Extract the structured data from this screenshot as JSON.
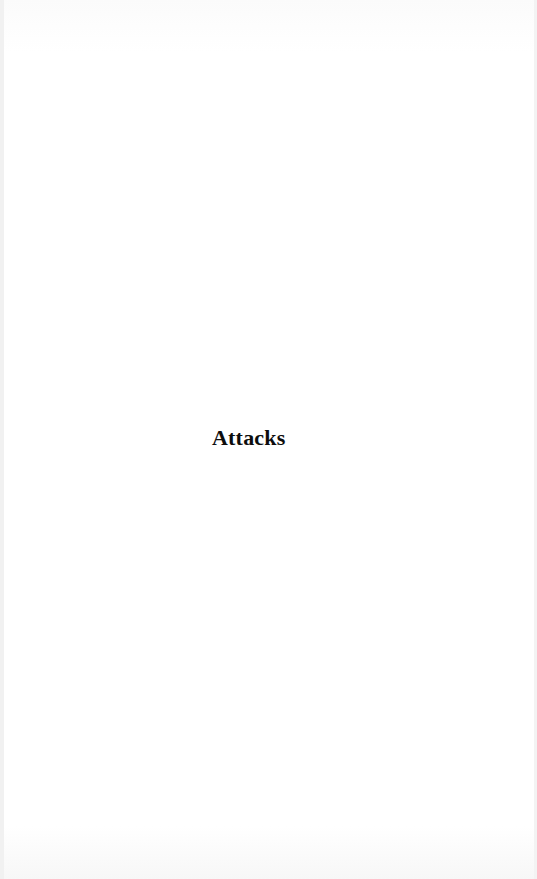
{
  "page": {
    "heading": "Attacks"
  }
}
